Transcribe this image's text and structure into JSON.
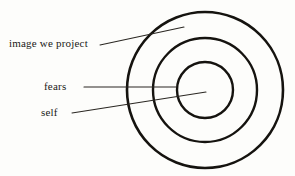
{
  "diagram": {
    "background_color": "#fdfdfb",
    "stroke_color": "#15130f",
    "leader_color": "#2a2722",
    "center": {
      "x": 205,
      "y": 90
    },
    "rings": [
      {
        "id": "outer-ring",
        "name": "image we project",
        "radius": 78,
        "stroke_width": 2.6
      },
      {
        "id": "middle-ring",
        "name": "fears",
        "radius": 52,
        "stroke_width": 2.4
      },
      {
        "id": "inner-ring",
        "name": "self",
        "radius": 28,
        "stroke_width": 2.4
      }
    ],
    "labels": [
      {
        "id": "image-we-project",
        "text": "image we project",
        "target_ring": "outer-ring"
      },
      {
        "id": "fears",
        "text": "fears",
        "target_ring": "middle-ring"
      },
      {
        "id": "self",
        "text": "self",
        "target_ring": "inner-ring"
      }
    ],
    "leader_lines": [
      {
        "id": "leader-image-we-project",
        "from": {
          "x": 100,
          "y": 45
        },
        "to": {
          "x": 184,
          "y": 27
        },
        "stroke_width": 1.1
      },
      {
        "id": "leader-fears",
        "from": {
          "x": 84,
          "y": 87
        },
        "to": {
          "x": 176,
          "y": 87
        },
        "stroke_width": 1.1
      },
      {
        "id": "leader-self",
        "from": {
          "x": 72,
          "y": 113
        },
        "to": {
          "x": 206,
          "y": 92
        },
        "stroke_width": 1.1
      }
    ]
  }
}
